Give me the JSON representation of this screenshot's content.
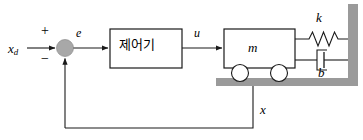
{
  "diagram": {
    "type": "control-block-diagram",
    "colors": {
      "line": "#1a1a1a",
      "wall": "#9a9a9a",
      "ground": "#9a9a9a",
      "summing_junction_fill": "#a8a8a8",
      "block_fill": "#ffffff",
      "block_stroke": "#1a1a1a",
      "background": "#ffffff"
    },
    "signals": {
      "reference": "x",
      "reference_subscript": "d",
      "error": "e",
      "control": "u",
      "output": "x"
    },
    "summing_junction": {
      "name": "summing-junction",
      "plus_sign": "+",
      "minus_sign": "−",
      "plus_input": "reference",
      "minus_input": "feedback"
    },
    "controller_block": {
      "label": "제어기",
      "input": "e",
      "output": "u"
    },
    "plant": {
      "mass_label": "m",
      "spring_label": "k",
      "damper_label": "b",
      "wheel_count": 2
    },
    "feedback": {
      "label": "x",
      "description": "position feedback from mass to summing junction"
    }
  }
}
